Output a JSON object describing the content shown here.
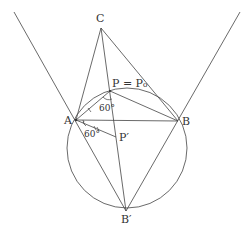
{
  "figure": {
    "type": "geometry-construction",
    "colors": {
      "stroke": "#444444",
      "text": "#333333",
      "background": "#ffffff"
    },
    "points": {
      "A": {
        "label": "A",
        "x": 76,
        "y": 120,
        "lx": 64,
        "ly": 124
      },
      "B": {
        "label": "B",
        "x": 178,
        "y": 121,
        "lx": 182,
        "ly": 125
      },
      "C": {
        "label": "C",
        "x": 101,
        "y": 28,
        "lx": 96,
        "ly": 22
      },
      "P": {
        "label": "P = P₀",
        "x": 110,
        "y": 91,
        "lx": 112,
        "ly": 87
      },
      "P_prime": {
        "label": "P′",
        "x": 116,
        "y": 137,
        "lx": 119,
        "ly": 141
      },
      "B_prime": {
        "label": "B′",
        "x": 126,
        "y": 211,
        "lx": 121,
        "ly": 223
      }
    },
    "circle": {
      "cx": 127,
      "cy": 148,
      "r": 60
    },
    "angles": [
      {
        "label": "60°",
        "x": 99,
        "y": 111
      },
      {
        "label": "60°",
        "x": 84,
        "y": 137
      }
    ]
  }
}
